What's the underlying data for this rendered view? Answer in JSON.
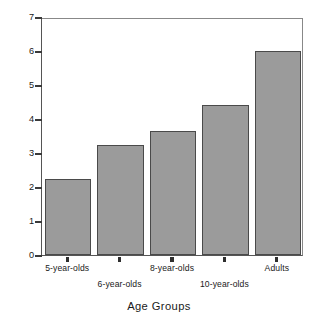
{
  "chart_data": {
    "type": "bar",
    "title": "",
    "xlabel": "Age Groups",
    "ylabel": "Number of Correctly Recalled Colors",
    "categories": [
      "5-year-olds",
      "6-year-olds",
      "8-year-olds",
      "10-year-olds",
      "Adults"
    ],
    "values": [
      2.25,
      3.25,
      3.65,
      4.4,
      6.0
    ],
    "series": [
      {
        "name": "Number of Correctly Recalled Colors",
        "values": [
          2.25,
          3.25,
          3.65,
          4.4,
          6.0
        ]
      }
    ],
    "ylim": [
      0,
      7
    ],
    "ytick_labels": [
      "7",
      "6",
      "5",
      "4",
      "3",
      "2",
      "1",
      "0"
    ],
    "yticks": [
      7,
      6,
      5,
      4,
      3,
      2,
      1,
      0
    ],
    "grid": false,
    "legend": "none",
    "bar_color": "#9b9b9b",
    "bar_edge_color": "#4a4a4a",
    "axis_color": "#555555",
    "background": "#ffffff",
    "label_rows": [
      "top",
      "bottom",
      "top",
      "bottom",
      "top"
    ]
  }
}
